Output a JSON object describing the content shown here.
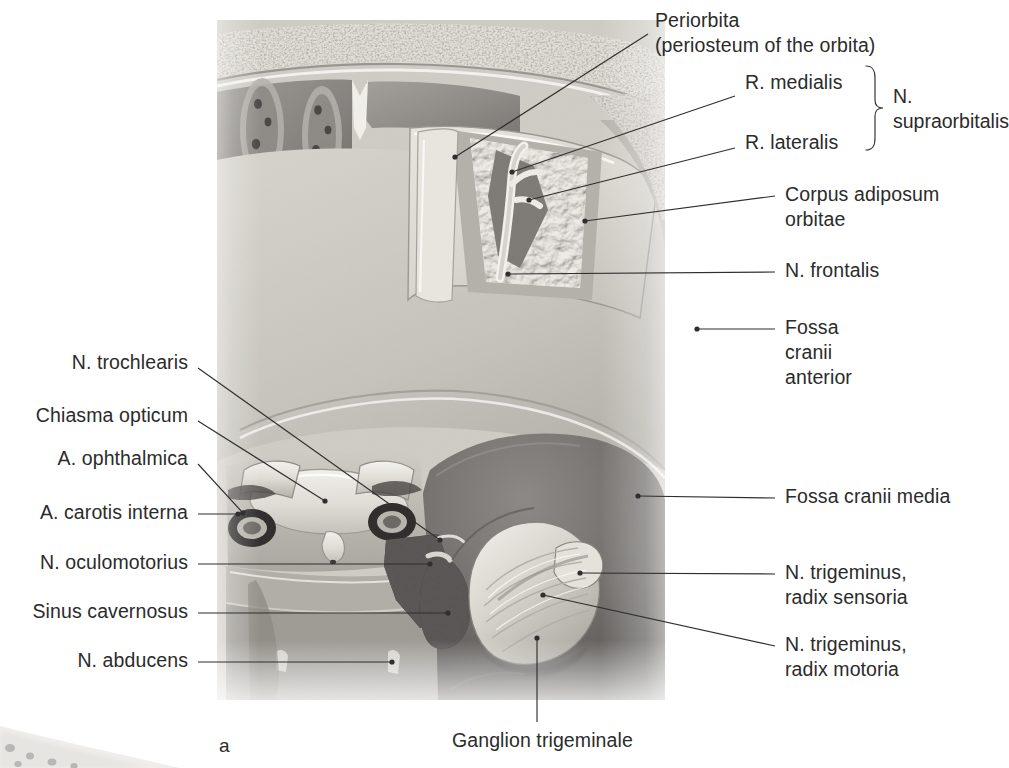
{
  "figure": {
    "panel_letter": "a",
    "title_text": "",
    "style": "grayscale anatomical illustration, superior view of orbital roof and middle cranial fossa"
  },
  "colors": {
    "text": "#2b2b2b",
    "leader_line": "#2f2f2f",
    "page_background": "#ffffff",
    "bone_light": "#d8d5cf",
    "bone_mid": "#b9b5ae",
    "dura_dark": "#6f6d6b",
    "fat_light": "#e6e3dc",
    "cavernous_dark": "#3a3836"
  },
  "labels_right": [
    {
      "id": "periorbita",
      "lines": [
        "Periorbita",
        "(periosteum of the orbita)"
      ],
      "text_x": 655,
      "text_y": 8,
      "leader": [
        [
          648,
          34
        ],
        [
          455,
          157
        ]
      ],
      "dot": [
        455,
        157
      ]
    },
    {
      "id": "r-medialis",
      "lines": [
        "R. medialis"
      ],
      "text_x": 745,
      "text_y": 70,
      "leader": [
        [
          735,
          96
        ],
        [
          512,
          172
        ]
      ],
      "dot": [
        512,
        172
      ]
    },
    {
      "id": "r-lateralis",
      "lines": [
        "R. lateralis"
      ],
      "text_x": 745,
      "text_y": 130,
      "leader": [
        [
          735,
          148
        ],
        [
          529,
          200
        ]
      ],
      "dot": [
        529,
        200
      ]
    },
    {
      "id": "corpus-adiposum-orbitae",
      "lines": [
        "Corpus adiposum",
        "orbitae"
      ],
      "text_x": 785,
      "text_y": 182,
      "leader": [
        [
          775,
          196
        ],
        [
          585,
          221
        ]
      ],
      "dot": [
        585,
        221
      ]
    },
    {
      "id": "n-frontalis",
      "lines": [
        "N. frontalis"
      ],
      "text_x": 785,
      "text_y": 258,
      "leader": [
        [
          775,
          272
        ],
        [
          508,
          274
        ]
      ],
      "dot": [
        508,
        274
      ]
    },
    {
      "id": "fossa-cranii-anterior",
      "lines": [
        "Fossa",
        "cranii",
        "anterior"
      ],
      "text_x": 785,
      "text_y": 315,
      "leader": [
        [
          775,
          329
        ],
        [
          697,
          329
        ]
      ],
      "dot": [
        697,
        329
      ]
    },
    {
      "id": "fossa-cranii-media",
      "lines": [
        "Fossa cranii media"
      ],
      "text_x": 785,
      "text_y": 484,
      "leader": [
        [
          775,
          498
        ],
        [
          638,
          496
        ]
      ],
      "dot": [
        638,
        496
      ]
    },
    {
      "id": "n-trigeminus-radix-sensoria",
      "lines": [
        "N. trigeminus,",
        "radix sensoria"
      ],
      "text_x": 785,
      "text_y": 560,
      "leader": [
        [
          775,
          574
        ],
        [
          580,
          573
        ]
      ],
      "dot": [
        580,
        573
      ]
    },
    {
      "id": "n-trigeminus-radix-motoria",
      "lines": [
        "N. trigeminus,",
        "radix motoria"
      ],
      "text_x": 785,
      "text_y": 632,
      "leader": [
        [
          775,
          646
        ],
        [
          543,
          595
        ]
      ],
      "dot": [
        543,
        595
      ]
    }
  ],
  "brace_group": {
    "label_lines": [
      "N.",
      "supraorbitalis"
    ],
    "label_x": 893,
    "label_y": 84,
    "brace_x": 875,
    "brace_top": 66,
    "brace_bottom": 150
  },
  "labels_left": [
    {
      "id": "n-trochlearis",
      "lines": [
        "N. trochlearis"
      ],
      "text_right": 188,
      "text_y": 350,
      "leader": [
        [
          198,
          368
        ],
        [
          440,
          540
        ]
      ],
      "dot": [
        440,
        540
      ]
    },
    {
      "id": "chiasma-opticum",
      "lines": [
        "Chiasma opticum"
      ],
      "text_right": 188,
      "text_y": 403,
      "leader": [
        [
          198,
          421
        ],
        [
          325,
          501
        ]
      ],
      "dot": [
        325,
        501
      ]
    },
    {
      "id": "a-ophthalmica",
      "lines": [
        "A. ophthalmica"
      ],
      "text_right": 188,
      "text_y": 446,
      "leader": [
        [
          198,
          464
        ],
        [
          243,
          513
        ]
      ],
      "dot": [
        243,
        513
      ]
    },
    {
      "id": "a-carotis-interna",
      "lines": [
        "A. carotis interna"
      ],
      "text_right": 188,
      "text_y": 500,
      "leader": [
        [
          198,
          514
        ],
        [
          238,
          514
        ]
      ],
      "dot": [
        238,
        514
      ]
    },
    {
      "id": "n-oculomotorius",
      "lines": [
        "N. oculomotorius"
      ],
      "text_right": 188,
      "text_y": 550,
      "leader": [
        [
          198,
          564
        ],
        [
          430,
          564
        ]
      ],
      "dot": [
        430,
        564
      ]
    },
    {
      "id": "sinus-cavernosus",
      "lines": [
        "Sinus cavernosus"
      ],
      "text_right": 188,
      "text_y": 599,
      "leader": [
        [
          198,
          613
        ],
        [
          448,
          613
        ]
      ],
      "dot": [
        448,
        613
      ]
    },
    {
      "id": "n-abducens",
      "lines": [
        "N. abducens"
      ],
      "text_right": 188,
      "text_y": 648,
      "leader": [
        [
          198,
          662
        ],
        [
          392,
          662
        ]
      ],
      "dot": [
        392,
        662
      ]
    }
  ],
  "labels_bottom": [
    {
      "id": "ganglion-trigeminale",
      "lines": [
        "Ganglion trigeminale"
      ],
      "text_x": 452,
      "text_y": 728,
      "leader": [
        [
          537,
          722
        ],
        [
          537,
          638
        ]
      ],
      "dot": [
        537,
        638
      ]
    }
  ],
  "panel_letter_pos": {
    "x": 219,
    "y": 735
  }
}
